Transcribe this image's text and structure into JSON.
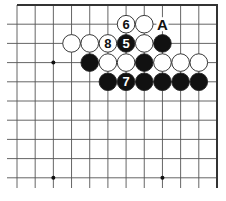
{
  "diagram": {
    "type": "go-board-fragment",
    "grid": {
      "columns": 12,
      "rows": 10,
      "origin_x": 17,
      "origin_y": 5,
      "col_spacing": 18.18,
      "row_spacing": 19.2,
      "edges": {
        "top": true,
        "right": true,
        "left": false,
        "bottom": false
      },
      "line_color": "#555555",
      "edge_color": "#333333"
    },
    "star_points": [
      {
        "col": 2,
        "row": 3
      },
      {
        "col": 2,
        "row": 9
      },
      {
        "col": 8,
        "row": 9
      }
    ],
    "stones": [
      {
        "col": 6,
        "row": 1,
        "color": "white",
        "label": "6"
      },
      {
        "col": 7,
        "row": 1,
        "color": "white",
        "label": ""
      },
      {
        "col": 3,
        "row": 2,
        "color": "white",
        "label": ""
      },
      {
        "col": 4,
        "row": 2,
        "color": "white",
        "label": ""
      },
      {
        "col": 5,
        "row": 2,
        "color": "white",
        "label": "8"
      },
      {
        "col": 6,
        "row": 2,
        "color": "black",
        "label": "5"
      },
      {
        "col": 7,
        "row": 2,
        "color": "white",
        "label": ""
      },
      {
        "col": 8,
        "row": 2,
        "color": "black",
        "label": ""
      },
      {
        "col": 4,
        "row": 3,
        "color": "black",
        "label": ""
      },
      {
        "col": 5,
        "row": 3,
        "color": "white",
        "label": ""
      },
      {
        "col": 6,
        "row": 3,
        "color": "white",
        "label": ""
      },
      {
        "col": 7,
        "row": 3,
        "color": "black",
        "label": ""
      },
      {
        "col": 8,
        "row": 3,
        "color": "white",
        "label": ""
      },
      {
        "col": 9,
        "row": 3,
        "color": "white",
        "label": ""
      },
      {
        "col": 10,
        "row": 3,
        "color": "white",
        "label": ""
      },
      {
        "col": 5,
        "row": 4,
        "color": "black",
        "label": ""
      },
      {
        "col": 6,
        "row": 4,
        "color": "black",
        "label": "7"
      },
      {
        "col": 7,
        "row": 4,
        "color": "black",
        "label": ""
      },
      {
        "col": 8,
        "row": 4,
        "color": "black",
        "label": ""
      },
      {
        "col": 9,
        "row": 4,
        "color": "black",
        "label": ""
      },
      {
        "col": 10,
        "row": 4,
        "color": "black",
        "label": ""
      }
    ],
    "marks": [
      {
        "col": 8,
        "row": 1,
        "label": "A"
      }
    ],
    "colors": {
      "black_stone": "#111111",
      "white_stone": "#ffffff",
      "stone_outline": "#222222",
      "label_on_black": "#ffffff",
      "label_on_white": "#111111"
    }
  }
}
